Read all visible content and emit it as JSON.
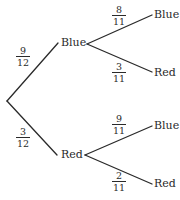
{
  "diagram": {
    "type": "probability-tree",
    "first_draw": {
      "branches": [
        {
          "outcome": "Blue",
          "probability": {
            "numerator": "9",
            "denominator": "12"
          }
        },
        {
          "outcome": "Red",
          "probability": {
            "numerator": "3",
            "denominator": "12"
          }
        }
      ]
    },
    "second_draw": {
      "after_blue": [
        {
          "outcome": "Blue",
          "probability": {
            "numerator": "8",
            "denominator": "11"
          }
        },
        {
          "outcome": "Red",
          "probability": {
            "numerator": "3",
            "denominator": "11"
          }
        }
      ],
      "after_red": [
        {
          "outcome": "Blue",
          "probability": {
            "numerator": "9",
            "denominator": "11"
          }
        },
        {
          "outcome": "Red",
          "probability": {
            "numerator": "2",
            "denominator": "11"
          }
        }
      ]
    }
  }
}
